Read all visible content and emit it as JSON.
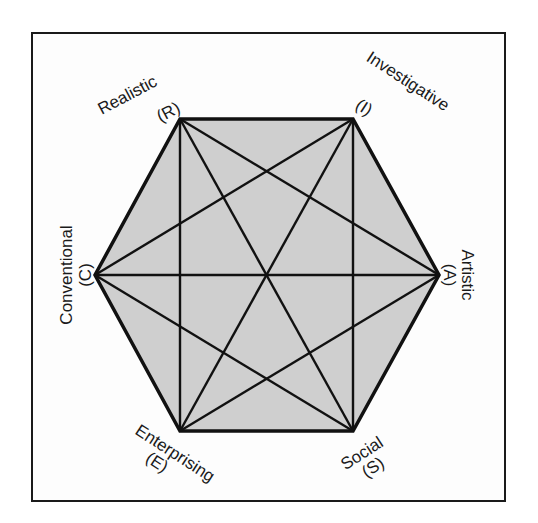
{
  "diagram": {
    "type": "hexagon-model",
    "title": "",
    "fill_color": "#cfcfcf",
    "line_color": "#111111",
    "vertices": [
      {
        "key": "R",
        "name": "Realistic",
        "code": "(R)",
        "x": 180,
        "y": 119
      },
      {
        "key": "I",
        "name": "Investigative",
        "code": "(I)",
        "x": 353,
        "y": 119
      },
      {
        "key": "A",
        "name": "Artistic",
        "code": "(A)",
        "x": 439,
        "y": 275
      },
      {
        "key": "S",
        "name": "Social",
        "code": "(S)",
        "x": 353,
        "y": 431
      },
      {
        "key": "E",
        "name": "Enterprising",
        "code": "(E)",
        "x": 180,
        "y": 431
      },
      {
        "key": "C",
        "name": "Conventional",
        "code": "(C)",
        "x": 95,
        "y": 275
      }
    ],
    "edges": "all pairs connected (complete graph K6)"
  },
  "labels": {
    "realistic": "Realistic",
    "realistic_code": "(R)",
    "investigative": "Investigative",
    "investigative_code": "(I)",
    "artistic": "Artistic",
    "artistic_code": "(A)",
    "social": "Social",
    "social_code": "(S)",
    "enterprising": "Enterprising",
    "enterprising_code": "(E)",
    "conventional": "Conventional",
    "conventional_code": "(C)"
  }
}
